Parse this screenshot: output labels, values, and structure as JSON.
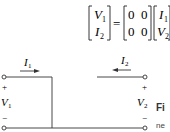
{
  "equation": {
    "lhs": [
      "V1",
      "I2"
    ],
    "lhs_sub": [
      "1",
      "2"
    ],
    "matrix": [
      [
        "0",
        "0"
      ],
      [
        "0",
        "0"
      ]
    ],
    "rhs": [
      "I1",
      "V2"
    ],
    "equals": "=",
    "terminator": "."
  },
  "circuit": {
    "labels": {
      "I1": "I",
      "I1_sub": "1",
      "I2": "I",
      "I2_sub": "2",
      "V1": "V",
      "V1_sub": "1",
      "V2": "V",
      "V2_sub": "2",
      "plus": "+",
      "minus": "−"
    }
  },
  "caption": {
    "fig": "Fi",
    "text": "ne"
  }
}
